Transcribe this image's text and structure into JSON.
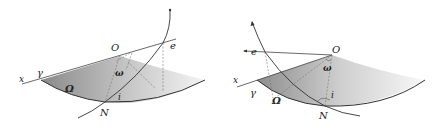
{
  "figures": [
    {
      "id": "left",
      "labels": {
        "x_axis": "x",
        "gamma": "γ",
        "origin": "O",
        "e": "e",
        "omega_small": "ω",
        "omega_capital": "Ω",
        "inclination": "i",
        "node": "N"
      }
    },
    {
      "id": "right",
      "labels": {
        "x_axis": "x",
        "gamma": "γ",
        "origin": "O",
        "e": "e",
        "omega_small": "ω",
        "omega_capital": "Ω",
        "inclination": "i",
        "node": "N"
      }
    }
  ],
  "colors": {
    "line": "#333333",
    "dashed": "#777777",
    "shade_dark": "#8a8a8a",
    "shade_light": "#ffffff"
  }
}
